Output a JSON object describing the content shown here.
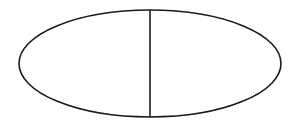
{
  "diagram": {
    "background": "#ffffff",
    "stroke_color": "#1a1a1a",
    "stroke_width": 1.6,
    "ellipse": {
      "cx": 150,
      "cy": 63.5,
      "rx": 131,
      "ry": 53.5
    },
    "divider": {
      "x": 150,
      "y1": 10,
      "y2": 117
    }
  }
}
